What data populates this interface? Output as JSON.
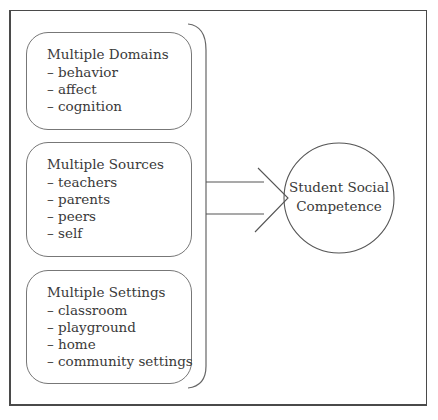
{
  "diagram": {
    "groups": [
      {
        "title": "Multiple Domains",
        "items": [
          "– behavior",
          "– affect",
          "– cognition"
        ]
      },
      {
        "title": "Multiple Sources",
        "items": [
          "– teachers",
          "– parents",
          "– peers",
          "– self"
        ]
      },
      {
        "title": "Multiple Settings",
        "items": [
          "– classroom",
          "– playground",
          "– home",
          "– community settings"
        ]
      }
    ],
    "outcome": {
      "line1": "Student Social",
      "line2": "Competence"
    },
    "arrow": {
      "direction": "right",
      "from": "groups",
      "to": "outcome"
    },
    "colors": {
      "stroke": "#555555",
      "text": "#3a3a3a",
      "background": "#ffffff"
    }
  }
}
